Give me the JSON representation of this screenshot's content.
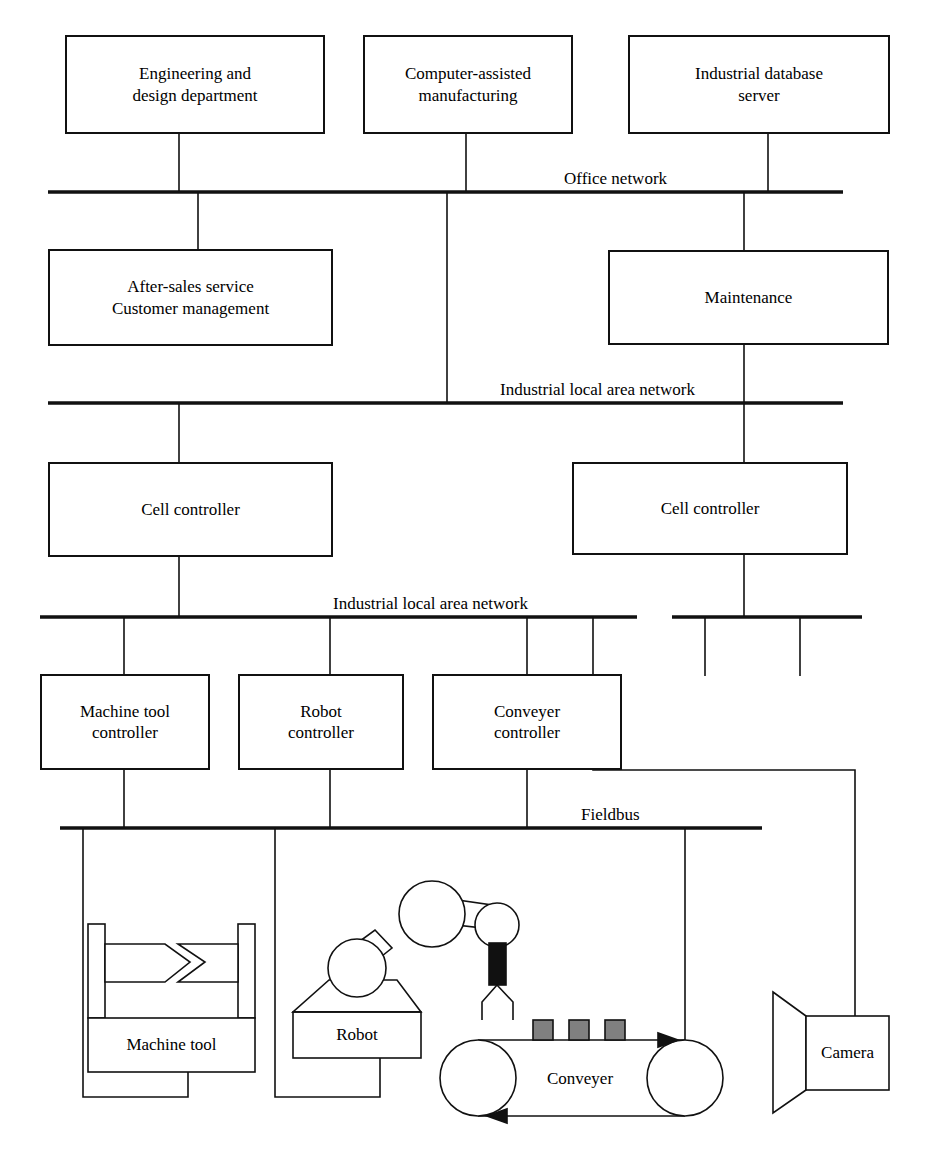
{
  "diagram": {
    "colors": {
      "line": "#111111",
      "background": "#ffffff",
      "block_fill": "#808080",
      "gripper_fill": "#111111"
    },
    "buses": [
      {
        "id": "office-network",
        "label": "Office network"
      },
      {
        "id": "industrial-lan-upper",
        "label": "Industrial local area network"
      },
      {
        "id": "industrial-lan-lower",
        "label": "Industrial local area network"
      },
      {
        "id": "fieldbus",
        "label": "Fieldbus"
      }
    ],
    "nodes": [
      {
        "id": "engineering-design",
        "lines": [
          "Engineering and",
          "design department"
        ]
      },
      {
        "id": "computer-assisted-manufacturing",
        "lines": [
          "Computer-assisted",
          "manufacturing"
        ]
      },
      {
        "id": "industrial-database-server",
        "lines": [
          "Industrial database",
          "server"
        ]
      },
      {
        "id": "after-sales-customer",
        "lines": [
          "After-sales service",
          "Customer management"
        ]
      },
      {
        "id": "maintenance",
        "lines": [
          "Maintenance"
        ]
      },
      {
        "id": "cell-controller-left",
        "lines": [
          "Cell controller"
        ]
      },
      {
        "id": "cell-controller-right",
        "lines": [
          "Cell controller"
        ]
      },
      {
        "id": "machine-tool-controller",
        "lines": [
          "Machine tool",
          "controller"
        ]
      },
      {
        "id": "robot-controller",
        "lines": [
          "Robot",
          "controller"
        ]
      },
      {
        "id": "conveyer-controller",
        "lines": [
          "Conveyer",
          "controller"
        ]
      }
    ],
    "equipment": [
      {
        "id": "machine-tool",
        "label": "Machine tool"
      },
      {
        "id": "robot",
        "label": "Robot"
      },
      {
        "id": "conveyer",
        "label": "Conveyer"
      },
      {
        "id": "camera",
        "label": "Camera"
      }
    ]
  }
}
